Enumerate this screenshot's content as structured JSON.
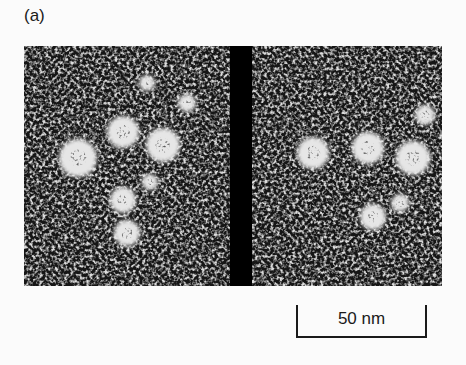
{
  "figure": {
    "panel_label": "(a)",
    "panels": [
      {
        "name": "left-micrograph",
        "particles": [
          {
            "cx": 54,
            "cy": 112,
            "r": 19
          },
          {
            "cx": 99,
            "cy": 86,
            "r": 16
          },
          {
            "cx": 139,
            "cy": 99,
            "r": 17
          },
          {
            "cx": 99,
            "cy": 154,
            "r": 13
          },
          {
            "cx": 103,
            "cy": 187,
            "r": 13
          },
          {
            "cx": 126,
            "cy": 136,
            "r": 8
          },
          {
            "cx": 123,
            "cy": 37,
            "r": 8
          },
          {
            "cx": 163,
            "cy": 57,
            "r": 9
          }
        ]
      },
      {
        "name": "right-micrograph",
        "particles": [
          {
            "cx": 289,
            "cy": 107,
            "r": 16
          },
          {
            "cx": 344,
            "cy": 102,
            "r": 16
          },
          {
            "cx": 389,
            "cy": 112,
            "r": 17
          },
          {
            "cx": 401,
            "cy": 69,
            "r": 10
          },
          {
            "cx": 349,
            "cy": 171,
            "r": 13
          },
          {
            "cx": 376,
            "cy": 157,
            "r": 9
          }
        ]
      }
    ],
    "divider_color": "#000000",
    "scale_bar": {
      "label": "50 nm"
    }
  }
}
